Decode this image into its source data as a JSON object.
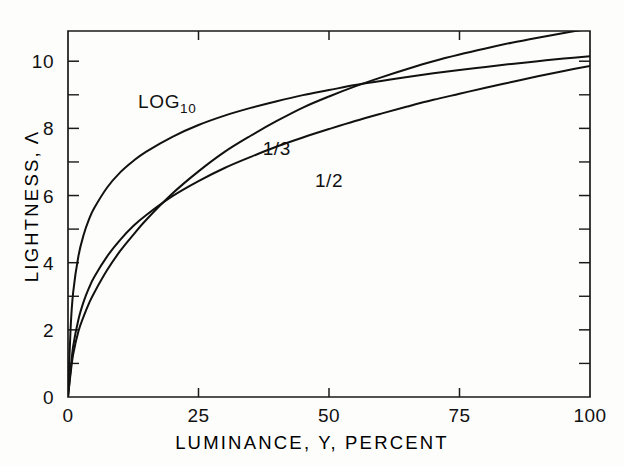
{
  "chart_data": {
    "type": "line",
    "title": "",
    "xlabel": "LUMINANCE, Y, PERCENT",
    "ylabel": "LIGHTNESS, Λ",
    "xlim": [
      0,
      100
    ],
    "ylim": [
      0,
      10.9
    ],
    "grid": false,
    "legend_position": "inline-curve-labels",
    "x_ticks": [
      0,
      25,
      50,
      75,
      100
    ],
    "x_tick_labels": [
      "0",
      "25",
      "50",
      "75",
      "100"
    ],
    "y_ticks": [
      0,
      2,
      4,
      6,
      8,
      10
    ],
    "y_tick_labels": [
      "0",
      "2",
      "4",
      "6",
      "8",
      "10"
    ],
    "y_minor_ticks": [
      1,
      3,
      5,
      7,
      9
    ],
    "x": [
      0,
      0.5,
      1,
      2,
      3,
      4,
      5,
      7.5,
      10,
      12.5,
      15,
      20,
      25,
      30,
      35,
      40,
      45,
      50,
      55,
      60,
      65,
      70,
      75,
      80,
      85,
      90,
      95,
      100
    ],
    "series": [
      {
        "name": "LOG10",
        "label": "LOG",
        "label_sub": "10",
        "values": [
          0.0,
          2.05,
          3.13,
          4.2,
          4.83,
          5.28,
          5.62,
          6.24,
          6.69,
          7.03,
          7.31,
          7.75,
          8.1,
          8.38,
          8.61,
          8.81,
          8.99,
          9.14,
          9.29,
          9.41,
          9.53,
          9.64,
          9.74,
          9.83,
          9.92,
          10.0,
          10.08,
          10.15
        ]
      },
      {
        "name": "cube-root",
        "label": "1/3",
        "label_sub": "",
        "values": [
          0.0,
          0.81,
          1.52,
          2.31,
          2.84,
          3.24,
          3.57,
          4.19,
          4.68,
          5.09,
          5.42,
          5.98,
          6.43,
          6.82,
          7.15,
          7.46,
          7.73,
          7.98,
          8.22,
          8.44,
          8.65,
          8.85,
          9.03,
          9.21,
          9.38,
          9.55,
          9.71,
          9.86
        ]
      },
      {
        "name": "square-root",
        "label": "1/2",
        "label_sub": "",
        "values": [
          0.0,
          0.7,
          1.28,
          1.96,
          2.4,
          2.78,
          3.1,
          3.78,
          4.35,
          4.83,
          5.28,
          6.06,
          6.72,
          7.3,
          7.78,
          8.22,
          8.62,
          8.95,
          9.25,
          9.52,
          9.77,
          10.0,
          10.2,
          10.38,
          10.55,
          10.7,
          10.84,
          10.97
        ]
      }
    ],
    "annotations": [
      {
        "text": "LOG",
        "subscript": "10",
        "x": 19,
        "y": 8.6,
        "name": "curve-label-log10"
      },
      {
        "text": "1/3",
        "subscript": "",
        "x": 40,
        "y": 7.2,
        "name": "curve-label-one-third"
      },
      {
        "text": "1/2",
        "subscript": "",
        "x": 50,
        "y": 6.25,
        "name": "curve-label-one-half"
      }
    ]
  },
  "axes": {
    "x_title": "LUMINANCE, Y, PERCENT",
    "y_title_text": "LIGHTNESS,",
    "y_title_symbol": "Λ"
  },
  "colors": {
    "ink": "#111111",
    "axis": "#1a1a1a",
    "background": "#fdfdfc"
  }
}
